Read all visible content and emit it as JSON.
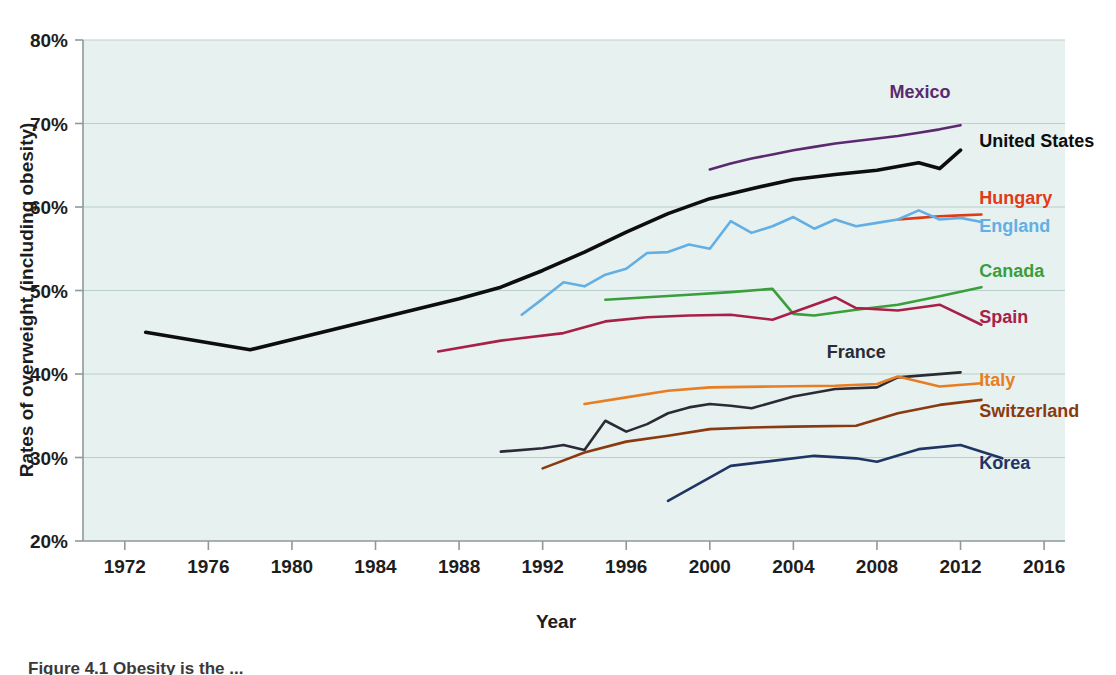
{
  "figure": {
    "caption": "Figure 4.1  Obesity is the ...",
    "background": "#ffffff",
    "plot_background": "#e6f1f0"
  },
  "chart_data": {
    "type": "line",
    "title": "",
    "xlabel": "Year",
    "ylabel": "Rates of overweight (including obesity)",
    "xlim": [
      1970,
      2017
    ],
    "ylim": [
      20,
      80
    ],
    "xticks": [
      1972,
      1976,
      1980,
      1984,
      1988,
      1992,
      1996,
      2000,
      2004,
      2008,
      2012,
      2016
    ],
    "xtick_labels": [
      "1972",
      "1976",
      "1980",
      "1984",
      "1988",
      "1992",
      "1996",
      "2000",
      "2004",
      "2008",
      "2012",
      "2016"
    ],
    "yticks": [
      20,
      30,
      40,
      50,
      60,
      70,
      80
    ],
    "ytick_labels": [
      "20%",
      "30%",
      "40%",
      "50%",
      "60%",
      "70%",
      "80%"
    ],
    "grid": true,
    "legend_position": "right-inline",
    "series": [
      {
        "name": "Mexico",
        "color": "#5b2a6e",
        "label_x": 2008.6,
        "label_y": 73.0,
        "points": [
          [
            2000,
            64.5
          ],
          [
            2001,
            65.2
          ],
          [
            2002,
            65.8
          ],
          [
            2003,
            66.3
          ],
          [
            2004,
            66.8
          ],
          [
            2005,
            67.2
          ],
          [
            2006,
            67.6
          ],
          [
            2007,
            67.9
          ],
          [
            2008,
            68.2
          ],
          [
            2009,
            68.5
          ],
          [
            2010,
            68.9
          ],
          [
            2011,
            69.3
          ],
          [
            2012,
            69.8
          ]
        ]
      },
      {
        "name": "United States",
        "color": "#0d0d0d",
        "label_x": 2012.9,
        "label_y": 67.2,
        "points": [
          [
            1973,
            45.0
          ],
          [
            1978,
            42.9
          ],
          [
            1988,
            49.0
          ],
          [
            1990,
            50.4
          ],
          [
            1992,
            52.4
          ],
          [
            1994,
            54.6
          ],
          [
            1996,
            57.0
          ],
          [
            1998,
            59.2
          ],
          [
            2000,
            61.0
          ],
          [
            2002,
            62.2
          ],
          [
            2004,
            63.3
          ],
          [
            2006,
            63.9
          ],
          [
            2008,
            64.4
          ],
          [
            2010,
            65.3
          ],
          [
            2011,
            64.6
          ],
          [
            2012,
            66.8
          ]
        ]
      },
      {
        "name": "Hungary",
        "color": "#e03a16",
        "label_x": 2012.9,
        "label_y": 60.4,
        "points": [
          [
            2009,
            58.5
          ],
          [
            2010,
            58.7
          ],
          [
            2011,
            58.9
          ],
          [
            2012,
            59.0
          ],
          [
            2013,
            59.1
          ]
        ]
      },
      {
        "name": "England",
        "color": "#63afe4",
        "label_x": 2012.9,
        "label_y": 57.0,
        "points": [
          [
            1991,
            47.1
          ],
          [
            1992,
            49.0
          ],
          [
            1993,
            51.0
          ],
          [
            1994,
            50.5
          ],
          [
            1995,
            51.9
          ],
          [
            1996,
            52.6
          ],
          [
            1997,
            54.5
          ],
          [
            1998,
            54.6
          ],
          [
            1999,
            55.5
          ],
          [
            2000,
            55.0
          ],
          [
            2001,
            58.3
          ],
          [
            2002,
            56.9
          ],
          [
            2003,
            57.7
          ],
          [
            2004,
            58.8
          ],
          [
            2005,
            57.4
          ],
          [
            2006,
            58.5
          ],
          [
            2007,
            57.7
          ],
          [
            2008,
            58.1
          ],
          [
            2009,
            58.5
          ],
          [
            2010,
            59.6
          ],
          [
            2011,
            58.5
          ],
          [
            2012,
            58.7
          ],
          [
            2013,
            58.2
          ]
        ]
      },
      {
        "name": "Canada",
        "color": "#3a9e3a",
        "label_x": 2012.9,
        "label_y": 51.6,
        "points": [
          [
            1995,
            48.9
          ],
          [
            1997,
            49.2
          ],
          [
            1999,
            49.5
          ],
          [
            2001,
            49.8
          ],
          [
            2003,
            50.2
          ],
          [
            2004,
            47.2
          ],
          [
            2005,
            47.0
          ],
          [
            2007,
            47.7
          ],
          [
            2009,
            48.3
          ],
          [
            2011,
            49.3
          ],
          [
            2013,
            50.4
          ]
        ]
      },
      {
        "name": "Spain",
        "color": "#a82048",
        "label_x": 2012.9,
        "label_y": 46.1,
        "points": [
          [
            1987,
            42.7
          ],
          [
            1990,
            44.0
          ],
          [
            1993,
            44.9
          ],
          [
            1995,
            46.3
          ],
          [
            1997,
            46.8
          ],
          [
            1999,
            47.0
          ],
          [
            2001,
            47.1
          ],
          [
            2003,
            46.5
          ],
          [
            2006,
            49.2
          ],
          [
            2007,
            47.9
          ],
          [
            2009,
            47.6
          ],
          [
            2011,
            48.3
          ],
          [
            2013,
            45.9
          ]
        ]
      },
      {
        "name": "France",
        "color": "#2b2b35",
        "label_x": 2005.6,
        "label_y": 41.9,
        "points": [
          [
            1990,
            30.7
          ],
          [
            1992,
            31.1
          ],
          [
            1993,
            31.5
          ],
          [
            1994,
            30.9
          ],
          [
            1995,
            34.4
          ],
          [
            1996,
            33.1
          ],
          [
            1997,
            34.0
          ],
          [
            1998,
            35.3
          ],
          [
            1999,
            36.0
          ],
          [
            2000,
            36.4
          ],
          [
            2001,
            36.2
          ],
          [
            2002,
            35.9
          ],
          [
            2004,
            37.3
          ],
          [
            2006,
            38.2
          ],
          [
            2008,
            38.4
          ],
          [
            2009,
            39.6
          ],
          [
            2012,
            40.2
          ]
        ]
      },
      {
        "name": "Italy",
        "color": "#e87d22",
        "label_x": 2012.9,
        "label_y": 38.6,
        "points": [
          [
            1994,
            36.4
          ],
          [
            1996,
            37.2
          ],
          [
            1998,
            38.0
          ],
          [
            2000,
            38.4
          ],
          [
            2003,
            38.5
          ],
          [
            2006,
            38.6
          ],
          [
            2008,
            38.8
          ],
          [
            2009,
            39.7
          ],
          [
            2011,
            38.5
          ],
          [
            2013,
            38.9
          ]
        ]
      },
      {
        "name": "Switzerland",
        "color": "#8a3a10",
        "label_x": 2012.9,
        "label_y": 34.8,
        "points": [
          [
            1992,
            28.7
          ],
          [
            1994,
            30.6
          ],
          [
            1996,
            31.9
          ],
          [
            1998,
            32.6
          ],
          [
            2000,
            33.4
          ],
          [
            2002,
            33.6
          ],
          [
            2004,
            33.7
          ],
          [
            2007,
            33.8
          ],
          [
            2009,
            35.3
          ],
          [
            2011,
            36.3
          ],
          [
            2013,
            36.9
          ]
        ]
      },
      {
        "name": "Korea",
        "color": "#1f3563",
        "label_x": 2012.9,
        "label_y": 28.6,
        "points": [
          [
            1998,
            24.8
          ],
          [
            2001,
            29.0
          ],
          [
            2003,
            29.6
          ],
          [
            2005,
            30.2
          ],
          [
            2007,
            29.9
          ],
          [
            2008,
            29.5
          ],
          [
            2010,
            31.0
          ],
          [
            2012,
            31.5
          ],
          [
            2014,
            29.9
          ]
        ]
      }
    ]
  }
}
